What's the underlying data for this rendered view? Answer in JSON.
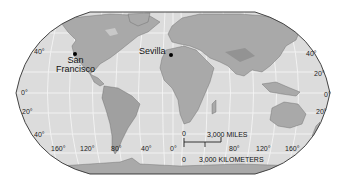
{
  "map": {
    "projection": "Robinson",
    "style": "grayscale",
    "colors": {
      "ocean": "#dcdcdc",
      "land": "#a9a9a9",
      "land_dark": "#8a8a8a",
      "graticule": "#f4f4f4",
      "border": "#555555",
      "frame": "#444444"
    },
    "cities": [
      {
        "name": "San Francisco",
        "line1": "San",
        "line2": "Francisco"
      },
      {
        "name": "Sevilla",
        "line1": "Sevilla"
      }
    ],
    "latitude_labels_left": [
      "40°",
      "0°",
      "20°",
      "40°"
    ],
    "latitude_labels_right": [
      "40°",
      "20°",
      "0°",
      "20°"
    ],
    "longitude_labels": [
      "160°",
      "120°",
      "80°",
      "40°",
      "0°",
      "80°",
      "120°",
      "160°"
    ],
    "scale_bar": {
      "top_zero": "0",
      "miles_label": "3,000 MILES",
      "bottom_zero": "0",
      "km_label": "3,000 KILOMETERS"
    }
  }
}
